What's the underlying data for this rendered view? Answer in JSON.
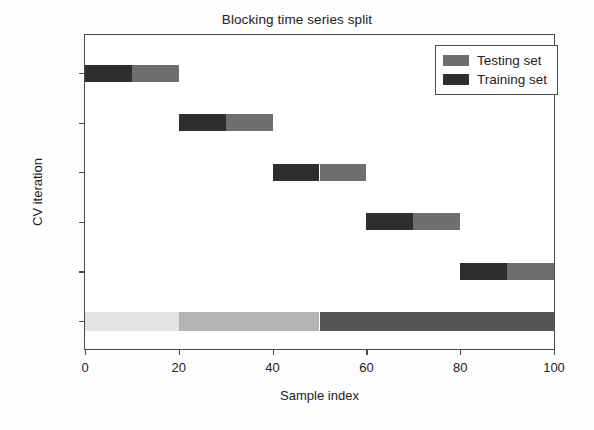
{
  "chart_data": {
    "type": "bar",
    "title": "Blocking time series split",
    "xlabel": "Sample index",
    "ylabel": "CV iteration",
    "xlim": [
      0,
      100
    ],
    "xticks": [
      0,
      20,
      40,
      60,
      80,
      100
    ],
    "xticklabels": [
      "0",
      "20",
      "40",
      "60",
      "80",
      "100"
    ],
    "yticklabels": [
      "0",
      "1",
      "2",
      "3",
      "4",
      "Class"
    ],
    "grid": false,
    "legend_position": "upper right",
    "legend": [
      {
        "label": "Testing set",
        "color": "#6e6e6e"
      },
      {
        "label": "Training set",
        "color": "#2e2e2e"
      }
    ],
    "rows": [
      {
        "name": "0",
        "segments": [
          {
            "kind": "Training set",
            "start": 0,
            "end": 10,
            "color": "#2e2e2e"
          },
          {
            "kind": "Testing set",
            "start": 10,
            "end": 20,
            "color": "#6e6e6e"
          }
        ]
      },
      {
        "name": "1",
        "segments": [
          {
            "kind": "Training set",
            "start": 20,
            "end": 30,
            "color": "#2e2e2e"
          },
          {
            "kind": "Testing set",
            "start": 30,
            "end": 40,
            "color": "#6e6e6e"
          }
        ]
      },
      {
        "name": "2",
        "segments": [
          {
            "kind": "Training set",
            "start": 40,
            "end": 50,
            "color": "#2e2e2e"
          },
          {
            "kind": "Testing set",
            "start": 50,
            "end": 60,
            "color": "#6e6e6e"
          }
        ]
      },
      {
        "name": "3",
        "segments": [
          {
            "kind": "Training set",
            "start": 60,
            "end": 70,
            "color": "#2e2e2e"
          },
          {
            "kind": "Testing set",
            "start": 70,
            "end": 80,
            "color": "#6e6e6e"
          }
        ]
      },
      {
        "name": "4",
        "segments": [
          {
            "kind": "Training set",
            "start": 80,
            "end": 90,
            "color": "#2e2e2e"
          },
          {
            "kind": "Testing set",
            "start": 90,
            "end": 100,
            "color": "#6e6e6e"
          }
        ]
      }
    ],
    "class_row": {
      "name": "Class",
      "segments": [
        {
          "class": 0,
          "start": 0,
          "end": 20,
          "color": "#e3e3e3"
        },
        {
          "class": 1,
          "start": 20,
          "end": 50,
          "color": "#b4b4b4"
        },
        {
          "class": 2,
          "start": 50,
          "end": 100,
          "color": "#555555"
        }
      ]
    }
  }
}
